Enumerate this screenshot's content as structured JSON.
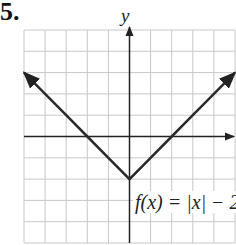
{
  "problem_number": "5.",
  "axis_labels": {
    "y": "y"
  },
  "function_label": "f(x) = |x| − 2",
  "colors": {
    "grid": "#c8c8c8",
    "axis": "#222222",
    "curve": "#2a2a2a",
    "background": "#ffffff"
  },
  "chart_data": {
    "type": "line",
    "title": "",
    "xlabel": "",
    "ylabel": "y",
    "xlim": [
      -5,
      5
    ],
    "ylim": [
      -5,
      5
    ],
    "grid": true,
    "legend_position": "none",
    "annotations": [
      {
        "text": "f(x) = |x| − 2",
        "position": "lower right of vertex"
      }
    ],
    "series": [
      {
        "name": "f(x) = |x| − 2",
        "x": [
          -5,
          -4,
          -3,
          -2,
          -1,
          0,
          1,
          2,
          3,
          4,
          5
        ],
        "values": [
          3,
          2,
          1,
          0,
          -1,
          -2,
          -1,
          0,
          1,
          2,
          3
        ],
        "arrows_at_ends": true
      }
    ],
    "vertex": [
      0,
      -2
    ],
    "x_intercepts": [
      -2,
      2
    ]
  }
}
